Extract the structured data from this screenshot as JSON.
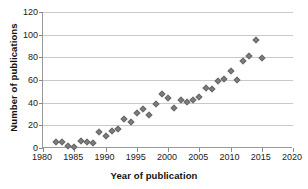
{
  "chart_data": {
    "type": "scatter",
    "title": "",
    "xlabel": "Year of publication",
    "ylabel": "Number of publications",
    "xlim": [
      1980,
      2020
    ],
    "ylim": [
      0,
      120
    ],
    "xticks": [
      1980,
      1985,
      1990,
      1995,
      2000,
      2005,
      2010,
      2015,
      2020
    ],
    "yticks": [
      0,
      20,
      40,
      60,
      80,
      100,
      120
    ],
    "grid": "horizontal",
    "legend": "none",
    "marker": "diamond",
    "marker_color": "#7d7d7d",
    "x": [
      1982,
      1983,
      1984,
      1985,
      1986,
      1987,
      1988,
      1989,
      1990,
      1991,
      1992,
      1993,
      1994,
      1995,
      1996,
      1997,
      1998,
      1999,
      2000,
      2001,
      2002,
      2003,
      2004,
      2005,
      2006,
      2007,
      2008,
      2009,
      2010,
      2011,
      2012,
      2013,
      2014,
      2015
    ],
    "values": [
      5,
      5,
      2,
      1,
      6,
      5,
      4,
      14,
      11,
      15,
      17,
      26,
      23,
      31,
      34,
      29,
      39,
      48,
      44,
      35,
      42,
      41,
      42,
      45,
      53,
      52,
      59,
      61,
      68,
      60,
      77,
      81,
      95,
      79
    ]
  }
}
